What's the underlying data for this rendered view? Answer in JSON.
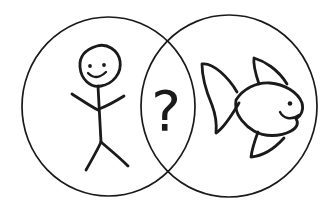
{
  "page": {
    "background_color": "#ffffff",
    "ink_color": "#1a1a1a"
  },
  "venn": {
    "kind": "hand-drawn-venn-diagram",
    "left_circle": {
      "content_icon": "stick-figure-person-icon"
    },
    "right_circle": {
      "content_icon": "fish-icon"
    },
    "intersection": {
      "symbol": "?"
    }
  }
}
